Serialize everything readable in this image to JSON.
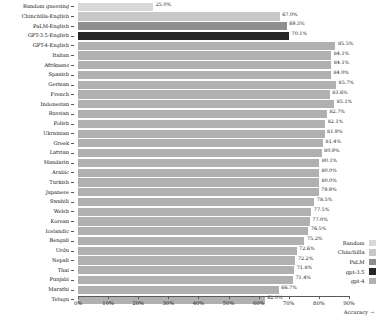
{
  "chart_data": {
    "type": "bar",
    "orientation": "horizontal",
    "title": "",
    "xlabel": "Accuracy →",
    "ylabel": "",
    "xlim": [
      0,
      90
    ],
    "xticks": [
      "0%",
      "10%",
      "20%",
      "30%",
      "40%",
      "50%",
      "60%",
      "70%",
      "80%",
      "90%"
    ],
    "xtick_values": [
      0,
      10,
      20,
      30,
      40,
      50,
      60,
      70,
      80,
      90
    ],
    "grid": false,
    "legend_position": "lower right",
    "categories": [
      "Random guessing",
      "Chinchilla-English",
      "PaLM-English",
      "GPT-3.5-English",
      "GPT-4-English",
      "Italian",
      "Afrikaans",
      "Spanish",
      "German",
      "French",
      "Indonesian",
      "Russian",
      "Polish",
      "Ukrainian",
      "Greek",
      "Latvian",
      "Mandarin",
      "Arabic",
      "Turkish",
      "Japanese",
      "Swahili",
      "Welsh",
      "Korean",
      "Icelandic",
      "Bengali",
      "Urdu",
      "Nepali",
      "Thai",
      "Punjabi",
      "Marathi",
      "Telugu"
    ],
    "values": [
      25.0,
      67.0,
      69.3,
      70.1,
      85.5,
      84.1,
      84.1,
      84.0,
      85.7,
      83.6,
      85.1,
      82.7,
      82.1,
      81.9,
      81.4,
      80.9,
      80.1,
      80.0,
      80.0,
      79.9,
      78.5,
      77.5,
      77.0,
      76.5,
      75.2,
      72.6,
      72.2,
      71.8,
      71.4,
      66.7,
      62.0
    ],
    "value_labels": [
      "25.0%",
      "67.0%",
      "69.3%",
      "70.1%",
      "85.5%",
      "84.1%",
      "84.1%",
      "84.0%",
      "85.7%",
      "83.6%",
      "85.1%",
      "82.7%",
      "82.1%",
      "81.9%",
      "81.4%",
      "80.9%",
      "80.1%",
      "80.0%",
      "80.0%",
      "79.9%",
      "78.5%",
      "77.5%",
      "77.0%",
      "76.5%",
      "75.2%",
      "72.6%",
      "72.2%",
      "71.8%",
      "71.4%",
      "66.7%",
      "62.0%"
    ],
    "series_of_bar": [
      "Random",
      "Chinchilla",
      "PaLM",
      "gpt-3.5",
      "gpt-4",
      "gpt-4",
      "gpt-4",
      "gpt-4",
      "gpt-4",
      "gpt-4",
      "gpt-4",
      "gpt-4",
      "gpt-4",
      "gpt-4",
      "gpt-4",
      "gpt-4",
      "gpt-4",
      "gpt-4",
      "gpt-4",
      "gpt-4",
      "gpt-4",
      "gpt-4",
      "gpt-4",
      "gpt-4",
      "gpt-4",
      "gpt-4",
      "gpt-4",
      "gpt-4",
      "gpt-4",
      "gpt-4",
      "gpt-4"
    ],
    "legend": [
      {
        "label": "Random",
        "color": "#d9d9d9"
      },
      {
        "label": "Chinchilla",
        "color": "#c8c8c8"
      },
      {
        "label": "PaLM",
        "color": "#8f8f8f"
      },
      {
        "label": "gpt-3.5",
        "color": "#262626"
      },
      {
        "label": "gpt-4",
        "color": "#b0b0b0"
      }
    ],
    "colors": {
      "Random": "#d9d9d9",
      "Chinchilla": "#c8c8c8",
      "PaLM": "#8f8f8f",
      "gpt-3.5": "#262626",
      "gpt-4": "#b0b0b0"
    }
  }
}
